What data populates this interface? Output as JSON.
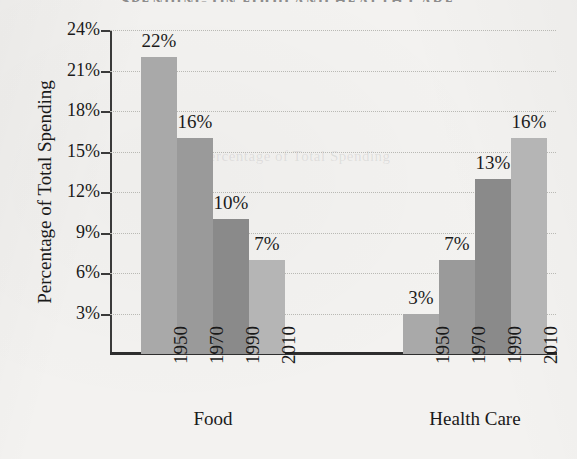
{
  "chart_data": {
    "type": "bar",
    "title": "SPENDING ON FOOD AND HEALTH CARE",
    "xlabel": "",
    "ylabel": "Percentage of Total Spending",
    "ylim": [
      0,
      24
    ],
    "ytick_step": 3,
    "ytick_labels": [
      "24%",
      "21%",
      "18%",
      "15%",
      "12%",
      "9%",
      "6%",
      "3%"
    ],
    "ytick_values": [
      24,
      21,
      18,
      15,
      12,
      9,
      6,
      3
    ],
    "grid": true,
    "legend": "none",
    "categories": [
      "1950",
      "1970",
      "1990",
      "2010"
    ],
    "groups": [
      {
        "name": "Food",
        "bars": [
          {
            "category": "1950",
            "value": 22,
            "label": "22%",
            "color": "#a9a9a9"
          },
          {
            "category": "1970",
            "value": 16,
            "label": "16%",
            "color": "#9a9a9a"
          },
          {
            "category": "1990",
            "value": 10,
            "label": "10%",
            "color": "#8a8a8a"
          },
          {
            "category": "2010",
            "value": 7,
            "label": "7%",
            "color": "#b5b5b5"
          }
        ]
      },
      {
        "name": "Health Care",
        "bars": [
          {
            "category": "1950",
            "value": 3,
            "label": "3%",
            "color": "#a9a9a9"
          },
          {
            "category": "1970",
            "value": 7,
            "label": "7%",
            "color": "#9a9a9a"
          },
          {
            "category": "1990",
            "value": 13,
            "label": "13%",
            "color": "#8a8a8a"
          },
          {
            "category": "2010",
            "value": 16,
            "label": "16%",
            "color": "#b5b5b5"
          }
        ]
      }
    ]
  },
  "ghost_text": {
    "middle": "Percentage of Total Spending"
  }
}
